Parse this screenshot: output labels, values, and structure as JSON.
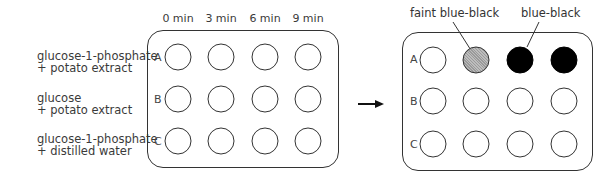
{
  "conditions": [
    {
      "line1": "glucose-1-phosphate",
      "line2": "+ potato extract"
    },
    {
      "line1": "glucose",
      "line2": "+ potato extract"
    },
    {
      "line1": "glucose-1-phosphate",
      "line2": "+ distilled water"
    }
  ],
  "times": [
    "0 min",
    "3 min",
    "6 min",
    "9 min"
  ],
  "rows": [
    "A",
    "B",
    "C"
  ],
  "before_plate": {
    "wells": [
      [
        "clear",
        "clear",
        "clear",
        "clear"
      ],
      [
        "clear",
        "clear",
        "clear",
        "clear"
      ],
      [
        "clear",
        "clear",
        "clear",
        "clear"
      ]
    ]
  },
  "after_plate": {
    "wells": [
      [
        "clear",
        "faint blue-black",
        "blue-black",
        "blue-black"
      ],
      [
        "clear",
        "clear",
        "clear",
        "clear"
      ],
      [
        "clear",
        "clear",
        "clear",
        "clear"
      ]
    ]
  },
  "annotations": {
    "faint": "faint blue-black",
    "dark": "blue-black"
  },
  "arrow": "right-arrow",
  "colors": {
    "outline": "#333333",
    "dark_well": "#000000",
    "faint_well": "#9a9a9a"
  }
}
